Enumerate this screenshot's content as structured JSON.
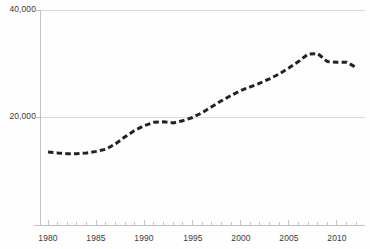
{
  "chart_data": {
    "type": "line",
    "title": "",
    "subtitle": "",
    "xlabel": "",
    "ylabel": "",
    "xlim": [
      1980,
      2012
    ],
    "ylim": [
      0,
      40000
    ],
    "grid": true,
    "legend_position": "none",
    "series_style": {
      "dash": true,
      "line_color": "#222222",
      "line_width": 3,
      "markers": false
    },
    "y_ticks": [
      {
        "value": 20000,
        "label": "20,000"
      },
      {
        "value": 40000,
        "label": "40,000"
      }
    ],
    "x_ticks": [
      {
        "value": 1980,
        "label": "1980"
      },
      {
        "value": 1985,
        "label": "1985"
      },
      {
        "value": 1990,
        "label": "1990"
      },
      {
        "value": 1995,
        "label": "1995"
      },
      {
        "value": 2000,
        "label": "2000"
      },
      {
        "value": 2005,
        "label": "2005"
      },
      {
        "value": 2010,
        "label": "2010"
      }
    ],
    "x_minor_tick_interval": 1,
    "x": [
      1980,
      1981,
      1982,
      1983,
      1984,
      1985,
      1986,
      1987,
      1988,
      1989,
      1990,
      1991,
      1992,
      1993,
      1994,
      1995,
      1996,
      1997,
      1998,
      1999,
      2000,
      2001,
      2002,
      2003,
      2004,
      2005,
      2006,
      2007,
      2008,
      2009,
      2010,
      2011,
      2012
    ],
    "values": [
      13600,
      13400,
      13250,
      13250,
      13400,
      13700,
      14100,
      15100,
      16400,
      17600,
      18500,
      19100,
      19200,
      19000,
      19400,
      20000,
      20900,
      22000,
      23100,
      24100,
      25000,
      25700,
      26400,
      27200,
      28100,
      29200,
      30400,
      31800,
      31900,
      30400,
      30300,
      30300,
      29300
    ],
    "series": [
      {
        "name": "series-1",
        "values": [
          13600,
          13400,
          13250,
          13250,
          13400,
          13700,
          14100,
          15100,
          16400,
          17600,
          18500,
          19100,
          19200,
          19000,
          19400,
          20000,
          20900,
          22000,
          23100,
          24100,
          25000,
          25700,
          26400,
          27200,
          28100,
          29200,
          30400,
          31800,
          31900,
          30400,
          30300,
          30300,
          29300
        ]
      }
    ]
  },
  "colors": {
    "line": "#222222",
    "gridline": "#d9d9d9",
    "axis": "#bfbfbf",
    "tick_text": "#3a3a3a",
    "background": "#fefefe"
  }
}
